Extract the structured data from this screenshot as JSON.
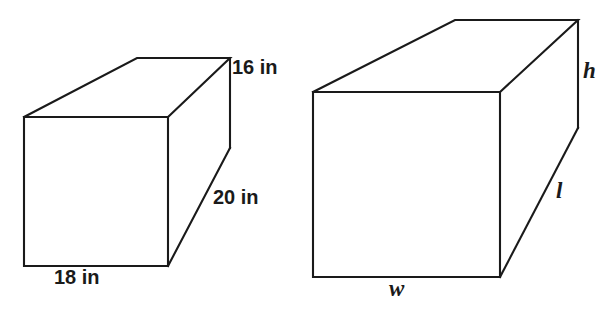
{
  "figure": {
    "background_color": "#ffffff",
    "stroke_color": "#1a1a1a",
    "prisms": [
      {
        "name": "labeled-prism",
        "description": "Rectangular prism with numeric inch dimensions",
        "labels": {
          "height": "16 in",
          "depth": "20 in",
          "width": "18 in"
        },
        "dimensions": {
          "height_value": 16,
          "depth_value": 20,
          "width_value": 18,
          "unit": "in"
        }
      },
      {
        "name": "variable-prism",
        "description": "Rectangular prism with variable dimensions",
        "labels": {
          "height": "h",
          "length": "l",
          "width": "w"
        }
      }
    ]
  }
}
